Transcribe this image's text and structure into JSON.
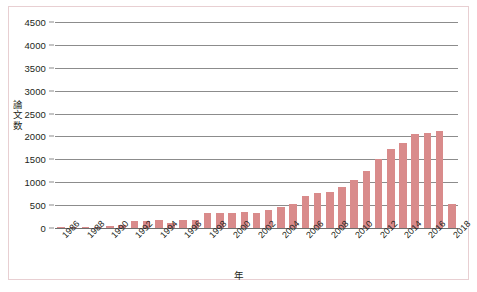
{
  "chart_data": {
    "type": "bar",
    "title": "",
    "subtitle": "",
    "xlabel": "年",
    "ylabel": "論文数",
    "categories": [
      "1986",
      "1987",
      "1988",
      "1989",
      "1990",
      "1991",
      "1992",
      "1993",
      "1994",
      "1995",
      "1996",
      "1997",
      "1998",
      "1999",
      "2000",
      "2001",
      "2002",
      "2003",
      "2004",
      "2005",
      "2006",
      "2007",
      "2008",
      "2009",
      "2010",
      "2011",
      "2012",
      "2013",
      "2014",
      "2015",
      "2016",
      "2017",
      "2018"
    ],
    "values": [
      10,
      12,
      20,
      25,
      40,
      75,
      160,
      150,
      185,
      120,
      165,
      175,
      320,
      330,
      330,
      345,
      320,
      390,
      450,
      530,
      690,
      760,
      780,
      900,
      1050,
      1250,
      1500,
      1720,
      1850,
      2050,
      2080,
      2120,
      530
    ],
    "ylim": [
      0,
      4500
    ],
    "yticks": [
      0,
      500,
      1000,
      1500,
      2000,
      2500,
      3000,
      3500,
      4000,
      4500
    ],
    "ytick_labels": [
      "0",
      "500",
      "1000",
      "1500",
      "2000",
      "2500",
      "3000",
      "3500",
      "4000",
      "4500"
    ],
    "xtick_labels": [
      "1986",
      "1988",
      "1990",
      "1992",
      "1994",
      "1996",
      "1998",
      "2000",
      "2002",
      "2004",
      "2006",
      "2008",
      "2010",
      "2012",
      "2014",
      "2016",
      "2018"
    ],
    "xtick_rotation": -45,
    "grid": true,
    "grid_axis": "y",
    "legend": false,
    "legend_position": "none",
    "bar_color": "#d98b8b",
    "grid_color": "#8c8c8c",
    "axis_color": "#6e6e6e",
    "border_color": "#e8cfd2",
    "background_color": "#ffffff"
  }
}
